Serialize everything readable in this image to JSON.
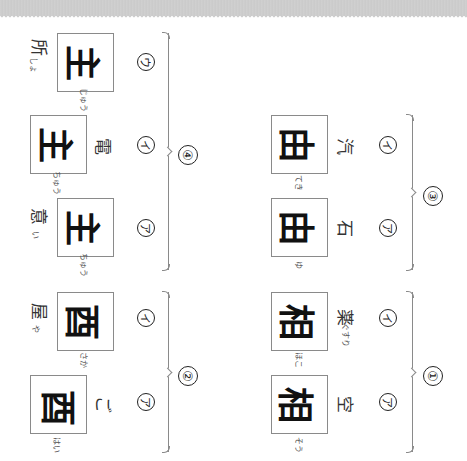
{
  "worksheet": {
    "orientation": "rotated-90",
    "groups": [
      {
        "label": "①",
        "items": [
          {
            "marker": "ア",
            "kanji": "相",
            "word": "空",
            "furigana": "そう"
          },
          {
            "marker": "イ",
            "kanji": "相",
            "word": "薬",
            "furigana": "ほこ",
            "word_furigana": "ぐすり"
          }
        ]
      },
      {
        "label": "②",
        "items": [
          {
            "marker": "ア",
            "kanji": "酉",
            "word": "ご",
            "furigana": "はい"
          },
          {
            "marker": "イ",
            "kanji": "酉",
            "word": "屋",
            "furigana": "さか",
            "word_furigana": "や"
          }
        ]
      },
      {
        "label": "③",
        "items": [
          {
            "marker": "ア",
            "kanji": "由",
            "word": "石",
            "furigana": "ゆ"
          },
          {
            "marker": "イ",
            "kanji": "由",
            "word": "汽",
            "furigana": "てき"
          }
        ]
      },
      {
        "label": "④",
        "items": [
          {
            "marker": "ア",
            "kanji": "主",
            "word": "意",
            "furigana": "ちゅう",
            "word_furigana": "い"
          },
          {
            "marker": "イ",
            "kanji": "主",
            "word": "電",
            "furigana": "ちゅう"
          },
          {
            "marker": "ウ",
            "kanji": "主",
            "word": "所",
            "furigana": "じゅう",
            "word_furigana": "しょ"
          }
        ]
      }
    ]
  }
}
